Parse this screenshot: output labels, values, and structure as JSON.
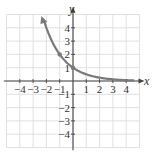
{
  "chart_data": {
    "type": "line",
    "title": "",
    "xlabel": "x",
    "ylabel": "y",
    "xlim": [
      -4.5,
      4.8
    ],
    "ylim": [
      -4.8,
      5
    ],
    "grid": true,
    "x_ticks": [
      -4,
      -3,
      -2,
      -1,
      1,
      2,
      3,
      4
    ],
    "y_ticks": [
      -4,
      -3,
      -2,
      -1,
      1,
      2,
      3,
      4
    ],
    "x_tick_labels": [
      "−4",
      "−3",
      "−2",
      "−1",
      "1",
      "2",
      "3",
      "4"
    ],
    "y_tick_labels": [
      "−4",
      "−3",
      "−2",
      "−1",
      "1",
      "2",
      "3",
      "4"
    ],
    "series": [
      {
        "name": "y = (1/2)^x",
        "x": [
          -2.2,
          -2,
          -1,
          0,
          1,
          2,
          3,
          4,
          4.5
        ],
        "values": [
          4.6,
          4,
          2,
          1,
          0.5,
          0.25,
          0.125,
          0.0625,
          0.044
        ],
        "marked_points": [
          [
            -1,
            2
          ],
          [
            0,
            1
          ]
        ],
        "color": "#7a7a7a",
        "arrow_left": true
      }
    ]
  },
  "colors": {
    "grid": "#d9d9d9",
    "axis": "#444444",
    "curve": "#7a7a7a"
  }
}
